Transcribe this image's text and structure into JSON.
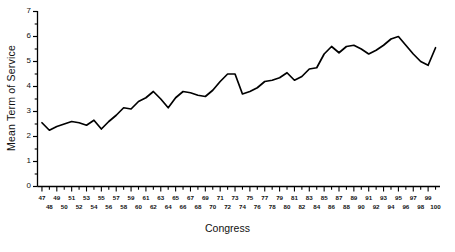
{
  "chart_data": {
    "type": "line",
    "title": "",
    "xlabel": "Congress",
    "ylabel": "Mean Term of Service",
    "xlim": [
      46.4,
      100.6
    ],
    "ylim": [
      0,
      7
    ],
    "grid": false,
    "legend": "none",
    "line_color": "#000000",
    "background_color": "#ffffff",
    "y_ticks_major": [
      0,
      1,
      2,
      3,
      4,
      5,
      6,
      7
    ],
    "y_ticks_minor": [
      0.5,
      1.5,
      2.5,
      3.5,
      4.5,
      5.5,
      6.5
    ],
    "x_ticks_top_row": [
      47,
      49,
      51,
      53,
      55,
      57,
      59,
      61,
      63,
      65,
      67,
      69,
      71,
      73,
      75,
      77,
      79,
      81,
      83,
      85,
      87,
      89,
      91,
      93,
      95,
      97,
      99
    ],
    "x_ticks_bottom_row": [
      48,
      50,
      52,
      54,
      56,
      58,
      60,
      62,
      64,
      66,
      68,
      70,
      72,
      74,
      76,
      78,
      80,
      82,
      84,
      86,
      88,
      90,
      92,
      94,
      96,
      98,
      100
    ],
    "x": [
      47,
      48,
      49,
      50,
      51,
      52,
      53,
      54,
      55,
      56,
      57,
      58,
      59,
      60,
      61,
      62,
      63,
      64,
      65,
      66,
      67,
      68,
      69,
      70,
      71,
      72,
      73,
      74,
      75,
      76,
      77,
      78,
      79,
      80,
      81,
      82,
      83,
      84,
      85,
      86,
      87,
      88,
      89,
      90,
      91,
      92,
      93,
      94,
      95,
      96,
      97,
      98,
      99,
      100
    ],
    "values": [
      2.55,
      2.25,
      2.4,
      2.5,
      2.6,
      2.55,
      2.45,
      2.65,
      2.3,
      2.6,
      2.85,
      3.15,
      3.1,
      3.4,
      3.55,
      3.8,
      3.5,
      3.15,
      3.55,
      3.8,
      3.75,
      3.65,
      3.6,
      3.85,
      4.2,
      4.5,
      4.5,
      3.7,
      3.8,
      3.95,
      4.2,
      4.25,
      4.35,
      4.55,
      4.25,
      4.4,
      4.7,
      4.75,
      5.3,
      5.6,
      5.35,
      5.6,
      5.65,
      5.5,
      5.3,
      5.45,
      5.65,
      5.9,
      6.0,
      5.65,
      5.3,
      5.0,
      4.85,
      5.55
    ],
    "series_name": "Mean Term of Service"
  },
  "axis": {
    "y_title": "Mean Term of Service",
    "x_title": "Congress"
  }
}
